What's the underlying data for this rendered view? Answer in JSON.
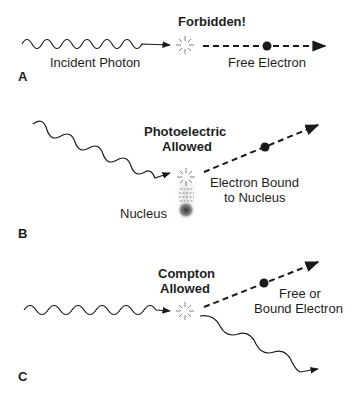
{
  "panels": [
    {
      "id": "A",
      "letter": "A",
      "title": "Forbidden!",
      "photon_label": "Incident Photon",
      "electron_label": "Free Electron"
    },
    {
      "id": "B",
      "letter": "B",
      "title_line1": "Photoelectric",
      "title_line2": "Allowed",
      "electron_label_line1": "Electron Bound",
      "electron_label_line2": "to Nucleus",
      "nucleus_label": "Nucleus"
    },
    {
      "id": "C",
      "letter": "C",
      "title_line1": "Compton",
      "title_line2": "Allowed",
      "electron_label_line1": "Free or",
      "electron_label_line2": "Bound Electron"
    }
  ],
  "colors": {
    "stroke": "#1a1a1a",
    "background": "#ffffff"
  }
}
